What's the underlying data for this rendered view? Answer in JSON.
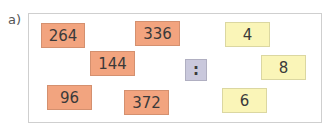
{
  "label": "a)",
  "dividends": [
    {
      "value": "264",
      "x": 41,
      "y": 23,
      "w": 44,
      "h": 25
    },
    {
      "value": "336",
      "x": 135,
      "y": 21,
      "w": 45,
      "h": 25
    },
    {
      "value": "144",
      "x": 90,
      "y": 51,
      "w": 45,
      "h": 25
    },
    {
      "value": "96",
      "x": 47,
      "y": 85,
      "w": 45,
      "h": 25
    },
    {
      "value": "372",
      "x": 124,
      "y": 90,
      "w": 45,
      "h": 25
    }
  ],
  "operator": {
    "symbol": ":",
    "x": 185,
    "y": 59,
    "w": 22,
    "h": 22
  },
  "divisors": [
    {
      "value": "4",
      "x": 225,
      "y": 22,
      "w": 45,
      "h": 25
    },
    {
      "value": "8",
      "x": 261,
      "y": 55,
      "w": 45,
      "h": 25
    },
    {
      "value": "6",
      "x": 222,
      "y": 88,
      "w": 45,
      "h": 25
    }
  ],
  "colors": {
    "dividend": "#f2a47f",
    "divisor": "#faf5b8",
    "operator": "#c9c8dc"
  }
}
